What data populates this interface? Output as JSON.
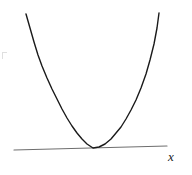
{
  "figure": {
    "name": "parabola-tangent-to-horizontal-line",
    "width": 192,
    "height": 175,
    "background_color": "#ffffff",
    "title": "",
    "caption": ""
  },
  "labels": {
    "x_axis": "x"
  },
  "colors": {
    "curve": "#1a1a1a",
    "axis_line": "#6e6e6e",
    "label": "#1a1a1a",
    "background": "#ffffff"
  },
  "chart_data": {
    "type": "line",
    "title": "",
    "xlabel": "x",
    "ylabel": "",
    "grid": false,
    "legend": null,
    "xlim": [
      0,
      192
    ],
    "ylim": [
      175,
      0
    ],
    "axes_visible": {
      "x_axis": true,
      "y_axis": false,
      "ticks": false,
      "tick_labels": false
    },
    "annotations": [
      {
        "name": "x-axis-label",
        "text": "x",
        "style": "italic-serif",
        "x": 173,
        "y": 157
      }
    ],
    "series": [
      {
        "name": "parabola",
        "type": "line",
        "description": "upward-opening parabola tangent to the horizontal line at its vertex",
        "color": "#1a1a1a",
        "linewidth": 1.4,
        "vertex": [
          93,
          148
        ],
        "points": [
          [
            26,
            14
          ],
          [
            30,
            28
          ],
          [
            34,
            42
          ],
          [
            38,
            55
          ],
          [
            42,
            66
          ],
          [
            47,
            78
          ],
          [
            52,
            89
          ],
          [
            57,
            99
          ],
          [
            62,
            109
          ],
          [
            67,
            118
          ],
          [
            72,
            126
          ],
          [
            77,
            133
          ],
          [
            82,
            139
          ],
          [
            87,
            144
          ],
          [
            93,
            148
          ],
          [
            99,
            147
          ],
          [
            105,
            144
          ],
          [
            111,
            139
          ],
          [
            116,
            133
          ],
          [
            121,
            127
          ],
          [
            126,
            119
          ],
          [
            131,
            110
          ],
          [
            136,
            100
          ],
          [
            141,
            88
          ],
          [
            146,
            74
          ],
          [
            150,
            60
          ],
          [
            154,
            44
          ],
          [
            157,
            28
          ],
          [
            159,
            13
          ]
        ]
      },
      {
        "name": "horizontal-axis-line",
        "type": "line",
        "description": "slightly tilted straight horizontal axis line touching the parabola vertex",
        "color": "#6e6e6e",
        "linewidth": 1.2,
        "points": [
          [
            14,
            150
          ],
          [
            167,
            146
          ]
        ]
      }
    ]
  }
}
